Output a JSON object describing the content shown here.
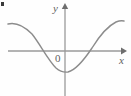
{
  "figure": {
    "background_color": "#fefefe",
    "stroke_color": "#8c8c8c",
    "axis_color": "#9a9a9a",
    "label_color": "#5f5f5f",
    "labels": {
      "y_axis": "y",
      "x_axis": "x",
      "origin": "0"
    }
  },
  "chart_data": {
    "type": "line",
    "title": "",
    "xlabel": "x",
    "ylabel": "y",
    "grid": false,
    "legend": null,
    "origin_label": "0",
    "axes": {
      "x_axis_pixel_y": 51,
      "y_axis_pixel_x": 65,
      "x_axis_extent_px": [
        8,
        124
      ],
      "y_axis_extent_px": [
        6,
        96
      ],
      "x_arrow": "right",
      "y_arrow": "up"
    },
    "curve_description": "even, cosine-shaped curve: maximum plateaus at both left and right edges, single minimum at the y-axis, two x-intercepts symmetric about the origin",
    "x": [
      8,
      14,
      20,
      26,
      32,
      38,
      42,
      48,
      54,
      60,
      65,
      70,
      76,
      82,
      88,
      90,
      96,
      102,
      108,
      114,
      120,
      124
    ],
    "y_pixel": [
      24,
      23,
      24,
      28,
      34,
      43,
      51,
      60,
      67,
      71,
      72,
      71,
      67,
      60,
      53,
      51,
      40,
      32,
      26,
      22,
      21,
      21
    ],
    "x_intercepts_px": [
      42,
      90
    ],
    "minimum_px": [
      65,
      72
    ],
    "maxima_px": [
      [
        13,
        23
      ],
      [
        122,
        21
      ]
    ],
    "path": "M 8 24 C 16 22 24 26 32 34 C 40 44 48 60 56 68 C 60 71.5 64 72.5 68 72 C 76 70 84 60 92 48 C 100 35 108 26 116 22 C 119 20.8 122 20.6 124 21"
  },
  "artifacts": {
    "corner_mark": "small dark speck at top-left corner"
  }
}
